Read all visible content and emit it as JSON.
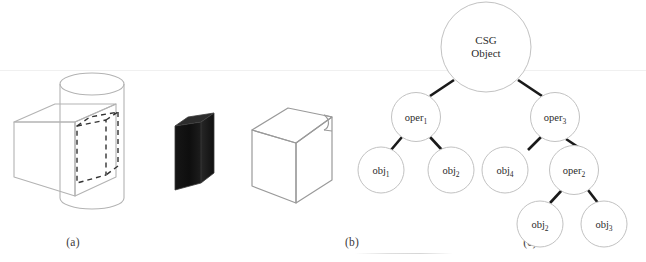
{
  "figure": {
    "background_color": "#ffffff",
    "line_color": "#b3b3b3",
    "dark_line_color": "#2a2a2a",
    "solid_fill_color": "#141414",
    "text_color": "#2b2b2b"
  },
  "panels": [
    {
      "id": "panel-a",
      "caption": "(a)",
      "description": "Wireframe cube intersecting a cylinder with dashed intersection volume outlined"
    },
    {
      "id": "panel-b",
      "caption": "(b)",
      "description": "Solid dark shaded block representing the resulting intersection solid"
    },
    {
      "id": "panel-c",
      "caption": "(c)",
      "description": "Wireframe cube with a small rounded notch cut from its top right corner"
    }
  ],
  "tree": {
    "title": "CSG tree",
    "nodes": [
      {
        "id": "root",
        "label": "CSG",
        "label_line2": "Object",
        "sub": "",
        "cx": 136,
        "cy": 47,
        "r": 45
      },
      {
        "id": "oper1",
        "label": "oper",
        "sub": "1",
        "cx": 66,
        "cy": 117,
        "r": 24.5
      },
      {
        "id": "oper3",
        "label": "oper",
        "sub": "3",
        "cx": 205,
        "cy": 117,
        "r": 24.5
      },
      {
        "id": "obj1",
        "label": "obj",
        "sub": "1",
        "cx": 31,
        "cy": 170,
        "r": 23
      },
      {
        "id": "obj2a",
        "label": "obj",
        "sub": "2",
        "cx": 101,
        "cy": 170,
        "r": 23
      },
      {
        "id": "obj4",
        "label": "obj",
        "sub": "4",
        "cx": 155,
        "cy": 170,
        "r": 23
      },
      {
        "id": "oper2",
        "label": "oper",
        "sub": "2",
        "cx": 224,
        "cy": 170,
        "r": 24.5
      },
      {
        "id": "obj2b",
        "label": "obj",
        "sub": "2",
        "cx": 190,
        "cy": 224,
        "r": 23
      },
      {
        "id": "obj3",
        "label": "obj",
        "sub": "3",
        "cx": 254,
        "cy": 224,
        "r": 23
      }
    ],
    "edges": [
      {
        "from": "root",
        "to": "oper1"
      },
      {
        "from": "root",
        "to": "oper3"
      },
      {
        "from": "oper1",
        "to": "obj1"
      },
      {
        "from": "oper1",
        "to": "obj2a"
      },
      {
        "from": "oper3",
        "to": "obj4"
      },
      {
        "from": "oper3",
        "to": "oper2"
      },
      {
        "from": "oper2",
        "to": "obj2b"
      },
      {
        "from": "oper2",
        "to": "obj3"
      }
    ]
  }
}
